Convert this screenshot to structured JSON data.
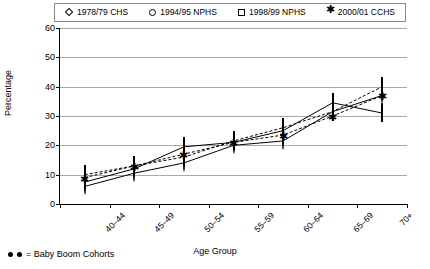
{
  "chart_data": {
    "type": "line",
    "title": "",
    "xlabel": "Age Group",
    "ylabel": "Percentage",
    "ylim": [
      0,
      60
    ],
    "yticks": [
      0,
      10,
      20,
      30,
      40,
      50,
      60
    ],
    "grid": true,
    "legend_position": "top",
    "categories": [
      "40–44",
      "45–49",
      "50–54",
      "55–59",
      "60–64",
      "65–69",
      "70+"
    ],
    "series": [
      {
        "name": "1978/79 CHS",
        "marker": "diamond",
        "values": [
          7.5,
          12.0,
          19.5,
          21.0,
          25.0,
          34.5,
          31.0
        ]
      },
      {
        "name": "1994/95 NPHS",
        "marker": "circle",
        "values": [
          6.0,
          10.5,
          14.0,
          20.0,
          21.5,
          31.5,
          37.0
        ]
      },
      {
        "name": "1998/99 NPHS",
        "marker": "square",
        "values": [
          10.0,
          13.0,
          16.0,
          21.5,
          26.0,
          31.5,
          40.0
        ]
      },
      {
        "name": "2000/01 CCHS",
        "marker": "asterisk",
        "values": [
          9.0,
          13.0,
          17.0,
          21.0,
          23.5,
          30.0,
          37.0
        ]
      }
    ],
    "annotation": "● ● = Baby Boom Cohorts"
  },
  "legend": {
    "items": [
      {
        "label": "1978/79 CHS",
        "marker": "diamond-marker-icon"
      },
      {
        "label": "1994/95 NPHS",
        "marker": "circle-marker-icon"
      },
      {
        "label": "1998/99 NPHS",
        "marker": "square-marker-icon"
      },
      {
        "label": "2000/01 CCHS",
        "marker": "asterisk-marker-icon"
      }
    ]
  },
  "footnote": {
    "text": "= Baby Boom Cohorts"
  },
  "colors": {
    "line": "#000000",
    "grid": "#a9a9a9",
    "background": "#ffffff"
  }
}
